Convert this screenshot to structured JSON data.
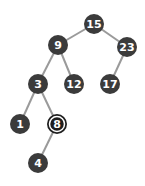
{
  "diagram": {
    "type": "binary-search-tree",
    "colors": {
      "node_fill": "#3b3b3b",
      "node_text": "#ffffff",
      "edge": "#9a9a9a",
      "highlight_ring": "#ffffff",
      "background": "#ffffff"
    },
    "nodes": [
      {
        "id": "n15",
        "label": "15",
        "x": 94,
        "y": 24,
        "highlighted": false
      },
      {
        "id": "n9",
        "label": "9",
        "x": 58,
        "y": 45,
        "highlighted": false
      },
      {
        "id": "n23",
        "label": "23",
        "x": 127,
        "y": 47,
        "highlighted": false
      },
      {
        "id": "n3",
        "label": "3",
        "x": 38,
        "y": 84,
        "highlighted": false
      },
      {
        "id": "n12",
        "label": "12",
        "x": 74,
        "y": 84,
        "highlighted": false
      },
      {
        "id": "n17",
        "label": "17",
        "x": 110,
        "y": 84,
        "highlighted": false
      },
      {
        "id": "n1",
        "label": "1",
        "x": 20,
        "y": 124,
        "highlighted": false
      },
      {
        "id": "n8",
        "label": "8",
        "x": 57,
        "y": 124,
        "highlighted": true
      },
      {
        "id": "n4",
        "label": "4",
        "x": 38,
        "y": 163,
        "highlighted": false
      }
    ],
    "edges": [
      {
        "from": "n15",
        "to": "n9"
      },
      {
        "from": "n15",
        "to": "n23"
      },
      {
        "from": "n9",
        "to": "n3"
      },
      {
        "from": "n9",
        "to": "n12"
      },
      {
        "from": "n23",
        "to": "n17"
      },
      {
        "from": "n3",
        "to": "n1"
      },
      {
        "from": "n3",
        "to": "n8"
      },
      {
        "from": "n8",
        "to": "n4"
      }
    ]
  }
}
